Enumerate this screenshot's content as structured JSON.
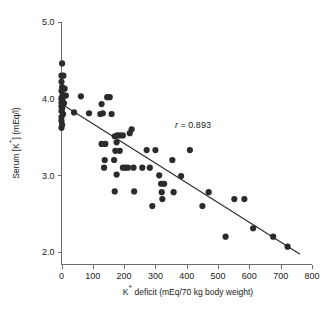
{
  "chart_data": {
    "type": "scatter",
    "title": "",
    "xlabel": "K+ deficit (mEq/70 kg body weight)",
    "xlabel_parts": {
      "prefix": "K",
      "sup": "+",
      "suffix": " deficit (mEq/70 kg body weight)"
    },
    "ylabel": "Serum [K+] (mEq/l)",
    "ylabel_parts": {
      "prefix": "Serum [K",
      "sup": "+",
      "suffix": "] (mEq/l)"
    },
    "xlim": [
      0,
      800
    ],
    "ylim": [
      2.0,
      5.0
    ],
    "xticks": [
      0,
      100,
      200,
      300,
      400,
      500,
      600,
      700,
      800
    ],
    "xtick_labels": [
      "0",
      "100",
      "200",
      "300",
      "400",
      "500",
      "600",
      "700",
      "800"
    ],
    "yticks": [
      2.0,
      3.0,
      4.0,
      5.0
    ],
    "ytick_labels": [
      "2.0",
      "3.0",
      "4.0",
      "5.0"
    ],
    "grid": false,
    "legend": null,
    "marker_color": "#2b2b2b",
    "marker_size": 3.1,
    "annotations": [
      {
        "name": "correlation",
        "symbol": "r",
        "equals": " = ",
        "value": "0.893",
        "x": 420,
        "y": 3.62
      }
    ],
    "fit_line": {
      "name": "regression-line",
      "color": "#2b2b2b",
      "x_start": 0,
      "y_start": 3.93,
      "x_end": 762,
      "y_end": 1.97
    },
    "points": [
      [
        2,
        4.46
      ],
      [
        0,
        4.3
      ],
      [
        6,
        4.3
      ],
      [
        0,
        4.22
      ],
      [
        2,
        4.15
      ],
      [
        10,
        4.13
      ],
      [
        0,
        4.1
      ],
      [
        4,
        4.05
      ],
      [
        14,
        4.04
      ],
      [
        0,
        4.01
      ],
      [
        3,
        3.98
      ],
      [
        0,
        3.95
      ],
      [
        8,
        3.94
      ],
      [
        0,
        3.9
      ],
      [
        2,
        3.87
      ],
      [
        0,
        3.84
      ],
      [
        5,
        3.8
      ],
      [
        0,
        3.76
      ],
      [
        0,
        3.71
      ],
      [
        2,
        3.66
      ],
      [
        0,
        3.62
      ],
      [
        62,
        4.03
      ],
      [
        40,
        3.82
      ],
      [
        88,
        3.81
      ],
      [
        128,
        3.93
      ],
      [
        132,
        3.81
      ],
      [
        146,
        4.02
      ],
      [
        154,
        4.02
      ],
      [
        124,
        3.8
      ],
      [
        160,
        3.8
      ],
      [
        128,
        3.41
      ],
      [
        140,
        3.41
      ],
      [
        138,
        3.2
      ],
      [
        136,
        3.1
      ],
      [
        170,
        3.51
      ],
      [
        178,
        3.52
      ],
      [
        186,
        3.52
      ],
      [
        196,
        3.52
      ],
      [
        218,
        3.55
      ],
      [
        224,
        3.6
      ],
      [
        176,
        3.43
      ],
      [
        172,
        3.32
      ],
      [
        186,
        3.32
      ],
      [
        168,
        3.2
      ],
      [
        176,
        3.01
      ],
      [
        170,
        2.79
      ],
      [
        196,
        3.1
      ],
      [
        204,
        3.1
      ],
      [
        212,
        3.1
      ],
      [
        230,
        3.1
      ],
      [
        232,
        2.79
      ],
      [
        258,
        3.1
      ],
      [
        272,
        3.33
      ],
      [
        282,
        3.1
      ],
      [
        290,
        2.6
      ],
      [
        300,
        3.33
      ],
      [
        312,
        3.0
      ],
      [
        318,
        2.89
      ],
      [
        328,
        2.89
      ],
      [
        320,
        2.78
      ],
      [
        322,
        2.69
      ],
      [
        354,
        3.2
      ],
      [
        358,
        2.78
      ],
      [
        382,
        2.99
      ],
      [
        410,
        3.33
      ],
      [
        450,
        2.6
      ],
      [
        470,
        2.78
      ],
      [
        524,
        2.2
      ],
      [
        552,
        2.69
      ],
      [
        584,
        2.69
      ],
      [
        612,
        2.31
      ],
      [
        676,
        2.2
      ],
      [
        722,
        2.07
      ]
    ]
  }
}
